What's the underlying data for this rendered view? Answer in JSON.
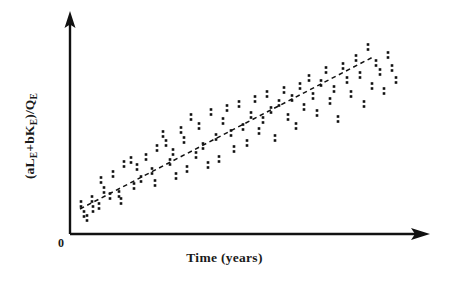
{
  "chart_data": {
    "type": "scatter",
    "title": "",
    "xlabel": "Time (years)",
    "ylabel": "(aL_E+bK_E)/Q_E",
    "ylabel_parts": {
      "open_paren": "(a",
      "var1": "L",
      "sub1": "E",
      "plus": "+b",
      "var2": "K",
      "sub2": "E",
      "close_slash": ")/Q",
      "sub3": "E"
    },
    "origin_label": "0",
    "grid": false,
    "legend": null,
    "axis_ticks": false,
    "marker_style": "double-dot (two stacked square dots)",
    "marker_color": "#111111",
    "trendline": {
      "style": "dashed",
      "color": "#111111",
      "x1": 80,
      "y1": 209,
      "x2": 373,
      "y2": 57
    },
    "axes": {
      "color": "#111111",
      "x_start": [
        70,
        234
      ],
      "x_end": [
        429,
        234
      ],
      "y_start": [
        70,
        234
      ],
      "y_end": [
        70,
        14
      ]
    },
    "points_px": [
      [
        81,
        204
      ],
      [
        84,
        214
      ],
      [
        87,
        218
      ],
      [
        92,
        199
      ],
      [
        93,
        209
      ],
      [
        99,
        206
      ],
      [
        101,
        180
      ],
      [
        104,
        190
      ],
      [
        110,
        196
      ],
      [
        113,
        174
      ],
      [
        119,
        194
      ],
      [
        121,
        201
      ],
      [
        124,
        164
      ],
      [
        131,
        160
      ],
      [
        134,
        186
      ],
      [
        137,
        167
      ],
      [
        141,
        179
      ],
      [
        146,
        157
      ],
      [
        152,
        171
      ],
      [
        155,
        183
      ],
      [
        157,
        148
      ],
      [
        163,
        134
      ],
      [
        166,
        143
      ],
      [
        170,
        162
      ],
      [
        173,
        152
      ],
      [
        176,
        176
      ],
      [
        181,
        130
      ],
      [
        184,
        140
      ],
      [
        187,
        169
      ],
      [
        191,
        117
      ],
      [
        196,
        155
      ],
      [
        199,
        126
      ],
      [
        203,
        146
      ],
      [
        208,
        165
      ],
      [
        211,
        112
      ],
      [
        216,
        137
      ],
      [
        219,
        159
      ],
      [
        223,
        121
      ],
      [
        227,
        108
      ],
      [
        231,
        133
      ],
      [
        234,
        149
      ],
      [
        239,
        104
      ],
      [
        243,
        127
      ],
      [
        247,
        143
      ],
      [
        251,
        115
      ],
      [
        255,
        99
      ],
      [
        259,
        131
      ],
      [
        263,
        120
      ],
      [
        267,
        94
      ],
      [
        271,
        110
      ],
      [
        275,
        138
      ],
      [
        279,
        103
      ],
      [
        284,
        90
      ],
      [
        288,
        117
      ],
      [
        292,
        98
      ],
      [
        296,
        126
      ],
      [
        300,
        86
      ],
      [
        304,
        107
      ],
      [
        309,
        78
      ],
      [
        313,
        96
      ],
      [
        317,
        113
      ],
      [
        321,
        83
      ],
      [
        326,
        70
      ],
      [
        330,
        101
      ],
      [
        334,
        89
      ],
      [
        338,
        119
      ],
      [
        343,
        66
      ],
      [
        347,
        80
      ],
      [
        351,
        94
      ],
      [
        356,
        58
      ],
      [
        360,
        75
      ],
      [
        364,
        104
      ],
      [
        368,
        47
      ],
      [
        372,
        86
      ],
      [
        376,
        63
      ],
      [
        380,
        72
      ],
      [
        384,
        91
      ],
      [
        388,
        55
      ],
      [
        392,
        68
      ],
      [
        396,
        80
      ]
    ]
  },
  "labels": {
    "x_axis": "Time (years)",
    "origin": "0"
  }
}
